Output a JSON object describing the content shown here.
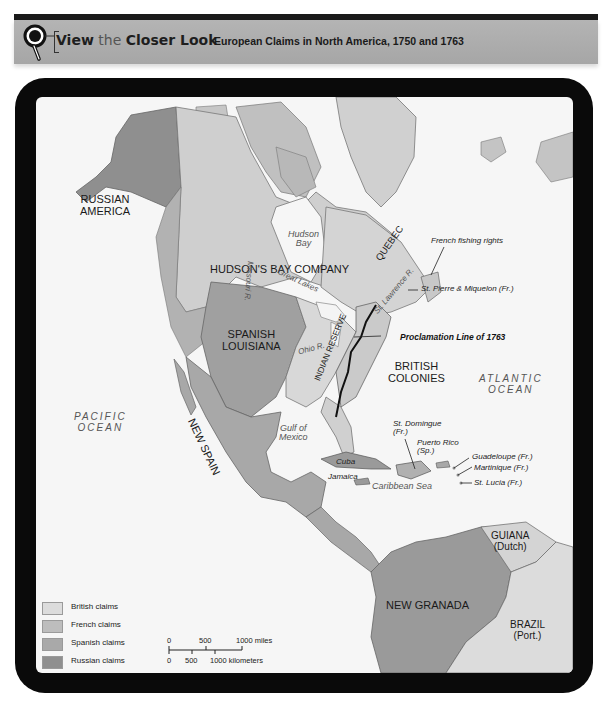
{
  "header": {
    "view_word": "View",
    "the_word": "the",
    "closer_look": "Closer Look",
    "map_title": "European Claims in North America, 1750 and 1763",
    "icon": "magnifier-icon"
  },
  "map": {
    "regions": {
      "russian_america": [
        "RUSSIAN",
        "AMERICA"
      ],
      "hudsons_bay_company": "HUDSON'S BAY COMPANY",
      "quebec": "QUEBEC",
      "spanish_louisiana": [
        "SPANISH",
        "LOUISIANA"
      ],
      "british_colonies": [
        "BRITISH",
        "COLONIES"
      ],
      "indian_reserve": "INDIAN RESERVE",
      "new_spain": "NEW SPAIN",
      "new_granada": "NEW GRANADA",
      "guiana": [
        "GUIANA",
        "(Dutch)"
      ],
      "brazil": [
        "BRAZIL",
        "(Port.)"
      ]
    },
    "water": {
      "hudson_bay": [
        "Hudson",
        "Bay"
      ],
      "pacific": [
        "PACIFIC",
        "OCEAN"
      ],
      "atlantic": [
        "ATLANTIC",
        "OCEAN"
      ],
      "gulf": [
        "Gulf of",
        "Mexico"
      ],
      "caribbean": "Caribbean Sea",
      "great_lakes": "Great Lakes",
      "st_lawrence": "St. Lawrence R.",
      "ohio": "Ohio R.",
      "missouri": "Missouri R."
    },
    "callouts": {
      "french_fishing": "French fishing rights",
      "st_pierre": "St. Pierre & Miquelon (Fr.)",
      "proclamation": "Proclamation Line of 1763",
      "st_domingue": [
        "St. Domingue",
        "(Fr.)"
      ],
      "puerto_rico": [
        "Puerto Rico",
        "(Sp.)"
      ],
      "guadeloupe": "Guadeloupe (Fr.)",
      "martinique": "Martinique (Fr.)",
      "st_lucia": "St. Lucia (Fr.)",
      "cuba": "Cuba",
      "jamaica": "Jamaica"
    }
  },
  "legend": {
    "items": [
      {
        "label": "British claims",
        "color": "#dcdcdc"
      },
      {
        "label": "French claims",
        "color": "#bdbdbd"
      },
      {
        "label": "Spanish claims",
        "color": "#a9a9a9"
      },
      {
        "label": "Russian claims",
        "color": "#8f8f8f"
      }
    ]
  },
  "scale": {
    "miles_ticks": [
      "0",
      "500",
      "1000 miles"
    ],
    "km_ticks": [
      "0",
      "500",
      "1000 kilometers"
    ]
  }
}
